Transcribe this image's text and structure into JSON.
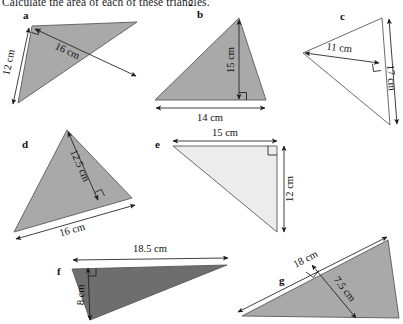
{
  "worksheet": {
    "title": "Calculate the area of each of these triangles.",
    "unit": "cm"
  },
  "palette": {
    "fill_mid_gray": "#a9a9a9",
    "fill_light_gray": "#ececec",
    "fill_dark_gray": "#6e6e6e",
    "outline": "#5a5a5a",
    "ink": "#111111",
    "page_background": "#ffffff"
  },
  "figures": [
    {
      "id": "a",
      "label": "a",
      "fill": "#a9a9a9",
      "dimensions": [
        {
          "name": "side-12cm",
          "text": "12 cm",
          "value": 12,
          "unit": "cm",
          "role": "side"
        },
        {
          "name": "height-16cm",
          "text": "16 cm",
          "value": 16,
          "unit": "cm",
          "role": "height"
        }
      ],
      "right_angle": true
    },
    {
      "id": "b",
      "label": "b",
      "fill": "#a9a9a9",
      "dimensions": [
        {
          "name": "height-15cm",
          "text": "15 cm",
          "value": 15,
          "unit": "cm",
          "role": "height"
        },
        {
          "name": "base-14cm",
          "text": "14 cm",
          "value": 14,
          "unit": "cm",
          "role": "base"
        }
      ],
      "right_angle": true
    },
    {
      "id": "c",
      "label": "c",
      "fill": "#ffffff",
      "dimensions": [
        {
          "name": "height-11cm",
          "text": "11 cm",
          "value": 11,
          "unit": "cm",
          "role": "height"
        },
        {
          "name": "base-17cm",
          "text": "17 cm",
          "value": 17,
          "unit": "cm",
          "role": "base"
        }
      ],
      "right_angle": true
    },
    {
      "id": "d",
      "label": "d",
      "fill": "#a9a9a9",
      "dimensions": [
        {
          "name": "height-12-5cm",
          "text": "12.5 cm",
          "value": 12.5,
          "unit": "cm",
          "role": "height"
        },
        {
          "name": "base-16cm",
          "text": "16 cm",
          "value": 16,
          "unit": "cm",
          "role": "base"
        }
      ],
      "right_angle": true
    },
    {
      "id": "e",
      "label": "e",
      "fill": "#ececec",
      "dimensions": [
        {
          "name": "base-15cm",
          "text": "15 cm",
          "value": 15,
          "unit": "cm",
          "role": "base"
        },
        {
          "name": "height-12cm",
          "text": "12 cm",
          "value": 12,
          "unit": "cm",
          "role": "height"
        }
      ],
      "right_angle": true
    },
    {
      "id": "f",
      "label": "f",
      "fill": "#6e6e6e",
      "dimensions": [
        {
          "name": "base-18-5cm",
          "text": "18.5 cm",
          "value": 18.5,
          "unit": "cm",
          "role": "base"
        },
        {
          "name": "height-8cm",
          "text": "8 cm",
          "value": 8,
          "unit": "cm",
          "role": "height"
        }
      ],
      "right_angle": true
    },
    {
      "id": "g",
      "label": "g",
      "fill": "#a9a9a9",
      "dimensions": [
        {
          "name": "base-18cm",
          "text": "18 cm",
          "value": 18,
          "unit": "cm",
          "role": "base"
        },
        {
          "name": "height-7-5cm",
          "text": "7.5 cm",
          "value": 7.5,
          "unit": "cm",
          "role": "height"
        }
      ],
      "right_angle": true
    }
  ]
}
